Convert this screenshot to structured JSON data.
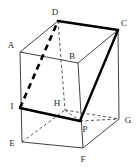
{
  "figure": {
    "kind": "geometry-diagram",
    "canvas": {
      "width": 138,
      "height": 167
    },
    "colors": {
      "background": "#ffffff",
      "stroke": "#2b2b2b",
      "thick_stroke": "#000000",
      "label": "#2b2b2b"
    },
    "vertices": [
      {
        "name": "A",
        "label": "A",
        "x": 20,
        "y": 52,
        "label_x": 11,
        "label_y": 45
      },
      {
        "name": "B",
        "label": "B",
        "x": 78,
        "y": 63,
        "label_x": 72,
        "label_y": 56
      },
      {
        "name": "C",
        "label": "C",
        "x": 118,
        "y": 30,
        "label_x": 124,
        "label_y": 23
      },
      {
        "name": "D",
        "label": "D",
        "x": 58,
        "y": 21,
        "label_x": 55,
        "label_y": 12
      },
      {
        "name": "E",
        "label": "E",
        "x": 22,
        "y": 142,
        "label_x": 12,
        "label_y": 143
      },
      {
        "name": "F",
        "label": "F",
        "x": 83,
        "y": 148,
        "label_x": 83,
        "label_y": 159
      },
      {
        "name": "G",
        "label": "G",
        "x": 119,
        "y": 119,
        "label_x": 128,
        "label_y": 120
      },
      {
        "name": "H",
        "label": "H",
        "x": 65,
        "y": 110,
        "label_x": 57,
        "label_y": 103
      },
      {
        "name": "I",
        "label": "I",
        "x": 20,
        "y": 108,
        "label_x": 12,
        "label_y": 106
      },
      {
        "name": "P",
        "label": "P",
        "x": 80,
        "y": 121,
        "label_x": 85,
        "label_y": 129
      }
    ],
    "edges": [
      {
        "name": "edge-A-D",
        "from": "A",
        "to": "D",
        "style": "solid",
        "weight": "thin"
      },
      {
        "name": "edge-A-B",
        "from": "A",
        "to": "B",
        "style": "solid",
        "weight": "thin"
      },
      {
        "name": "edge-B-C",
        "from": "B",
        "to": "C",
        "style": "solid",
        "weight": "thin"
      },
      {
        "name": "edge-D-C",
        "from": "D",
        "to": "C",
        "style": "solid",
        "weight": "thick"
      },
      {
        "name": "edge-A-E",
        "from": "A",
        "to": "E",
        "style": "solid",
        "weight": "thin"
      },
      {
        "name": "edge-C-G",
        "from": "C",
        "to": "G",
        "style": "solid",
        "weight": "thin"
      },
      {
        "name": "edge-B-F",
        "from": "B",
        "to": "F",
        "style": "solid",
        "weight": "thin"
      },
      {
        "name": "edge-E-F",
        "from": "E",
        "to": "F",
        "style": "solid",
        "weight": "thin"
      },
      {
        "name": "edge-F-G",
        "from": "F",
        "to": "G",
        "style": "solid",
        "weight": "thin"
      },
      {
        "name": "edge-D-H",
        "from": "D",
        "to": "H",
        "style": "dashed",
        "weight": "thin"
      },
      {
        "name": "edge-E-H",
        "from": "E",
        "to": "H",
        "style": "dashed",
        "weight": "thin"
      },
      {
        "name": "edge-H-G",
        "from": "H",
        "to": "G",
        "style": "dashed",
        "weight": "thin"
      },
      {
        "name": "edge-I-D",
        "from": "I",
        "to": "D",
        "style": "dashed",
        "weight": "thick"
      },
      {
        "name": "edge-I-P",
        "from": "I",
        "to": "P",
        "style": "solid",
        "weight": "thick"
      },
      {
        "name": "edge-P-C",
        "from": "P",
        "to": "C",
        "style": "solid",
        "weight": "thick"
      },
      {
        "name": "edge-P-G",
        "from": "P",
        "to": "G",
        "style": "dashed",
        "weight": "thin"
      },
      {
        "name": "edge-H-P",
        "from": "H",
        "to": "P",
        "style": "dashed",
        "weight": "thin"
      }
    ]
  }
}
